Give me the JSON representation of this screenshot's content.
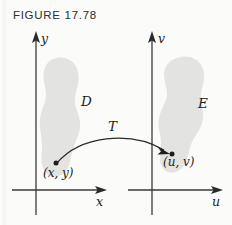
{
  "figure": {
    "title": "FIGURE 17.78",
    "background_color": "#fbfbf9",
    "ink_color": "#1d1d1d",
    "region_fill_color": "#e3e3e2"
  },
  "left_plot": {
    "y_axis_label": "y",
    "x_axis_label": "x",
    "region_label": "D",
    "point_label": "(x, y)"
  },
  "right_plot": {
    "v_axis_label": "v",
    "u_axis_label": "u",
    "region_label": "E",
    "point_label": "(u, v)"
  },
  "mapping": {
    "transform_label": "T"
  }
}
